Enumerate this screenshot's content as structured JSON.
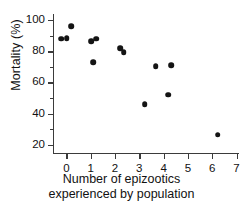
{
  "chart_data": {
    "type": "scatter",
    "title": "",
    "xlabel": "Number of epizootics experienced by population",
    "xlabel_line1": "Number of epizootics",
    "xlabel_line2": "experienced by population",
    "ylabel": "Mortality (%)",
    "xlim": [
      -0.55,
      7.1
    ],
    "ylim": [
      14,
      104
    ],
    "xticks": [
      0,
      1,
      2,
      3,
      4,
      5,
      6,
      7
    ],
    "xtick_labels": [
      "0",
      "1",
      "2",
      "3",
      "4",
      "5",
      "6",
      "7"
    ],
    "yticks": [
      20,
      40,
      60,
      80,
      100
    ],
    "ytick_labels": [
      "20",
      "40",
      "60",
      "80",
      "100"
    ],
    "yticks_minor": [
      30,
      50,
      70,
      90
    ],
    "grid": false,
    "legend": null,
    "marker_color": "#141414",
    "axis_color": "#3b3b3b",
    "points": [
      {
        "x": -0.22,
        "y": 88.0
      },
      {
        "x": 0.02,
        "y": 88.5
      },
      {
        "x": 0.2,
        "y": 96.0
      },
      {
        "x": 1.02,
        "y": 86.5
      },
      {
        "x": 1.22,
        "y": 88.0
      },
      {
        "x": 1.1,
        "y": 73.0
      },
      {
        "x": 2.22,
        "y": 82.0
      },
      {
        "x": 2.35,
        "y": 79.5
      },
      {
        "x": 3.22,
        "y": 46.0
      },
      {
        "x": 3.68,
        "y": 70.5
      },
      {
        "x": 4.32,
        "y": 71.0
      },
      {
        "x": 4.2,
        "y": 52.0
      },
      {
        "x": 6.22,
        "y": 26.5
      }
    ]
  }
}
